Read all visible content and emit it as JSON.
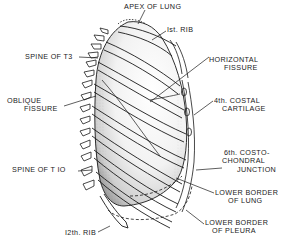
{
  "figure": {
    "labels": {
      "apex": "APEX OF LUNG",
      "first_rib": "Ist. RIB",
      "spine_t3": "SPINE OF T3",
      "horizontal_fissure_1": "HORIZONTAL",
      "horizontal_fissure_2": "FISSURE",
      "oblique_fissure_1": "OBLIQUE",
      "oblique_fissure_2": "FISSURE",
      "costal_cartilage_1": "4th. COSTAL",
      "costal_cartilage_2": "CARTILAGE",
      "costochondral_1": "6th. COSTO-",
      "costochondral_2": "CHONDRAL",
      "costochondral_3": "JUNCTION",
      "spine_t10": "SPINE OF T IO",
      "lower_lung_1": "LOWER BORDER",
      "lower_lung_2": "OF LUNG",
      "twelfth_rib": "I2th. RIB",
      "lower_pleura_1": "LOWER BORDER",
      "lower_pleura_2": "OF PLEURA"
    },
    "colors": {
      "ink": "#1a1a1a",
      "background": "#ffffff",
      "shade": "#8a8a8a"
    }
  }
}
